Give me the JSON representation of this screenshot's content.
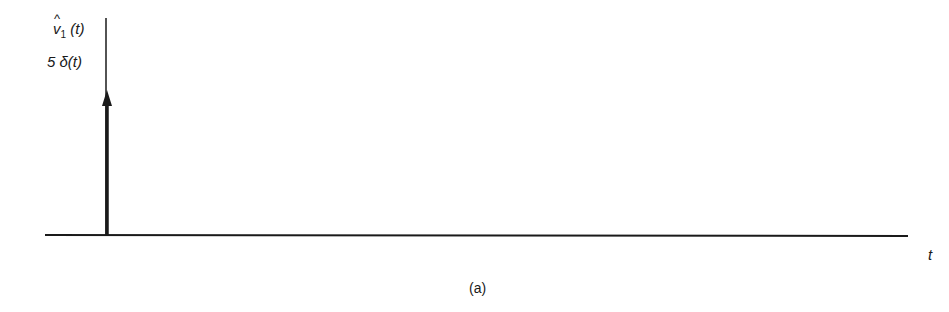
{
  "figure": {
    "caption": "(a)",
    "y_axis_label": {
      "symbol": "v",
      "hat": "^",
      "subscript": "1",
      "argument": "(t)"
    },
    "impulse_label": "5 δ(t)",
    "x_axis_label": "t"
  },
  "colors": {
    "ink": "#1a1a1a",
    "background": "#ffffff"
  },
  "impulse": {
    "position": "t = 0",
    "strength": 5
  }
}
